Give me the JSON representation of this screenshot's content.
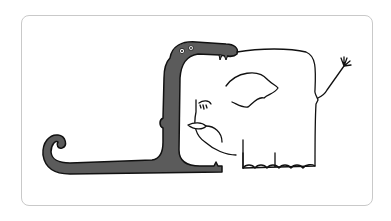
{
  "illustration": {
    "subject": "snake swallowing an elephant",
    "colors": {
      "frame_border": "#c9c9c9",
      "background": "#ffffff",
      "snake_fill": "#5b5b5b",
      "outline": "#111111",
      "elephant_fill": "#ffffff"
    }
  }
}
